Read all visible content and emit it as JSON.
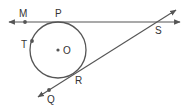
{
  "diagram": {
    "type": "geometry-tangent-lines-circle",
    "stroke_color": "#555555",
    "circle": {
      "center_label": "O",
      "cx": 58,
      "cy": 50,
      "r": 28
    },
    "points": [
      {
        "id": "M",
        "label": "M",
        "x": 25,
        "y": 22,
        "lx": 19,
        "ly": 17,
        "dot": true
      },
      {
        "id": "P",
        "label": "P",
        "x": 58,
        "y": 22,
        "lx": 55,
        "ly": 17,
        "dot": false
      },
      {
        "id": "S",
        "label": "S",
        "x": 157,
        "y": 22,
        "lx": 155,
        "ly": 34,
        "dot": false
      },
      {
        "id": "T",
        "label": "T",
        "x": 32,
        "y": 41,
        "lx": 21,
        "ly": 48,
        "dot": true
      },
      {
        "id": "O",
        "label": "O",
        "x": 58,
        "y": 50,
        "lx": 63,
        "ly": 54,
        "dot": true
      },
      {
        "id": "R",
        "label": "R",
        "x": 73,
        "y": 75,
        "lx": 75,
        "ly": 84,
        "dot": false
      },
      {
        "id": "Q",
        "label": "Q",
        "x": 49,
        "y": 90,
        "lx": 47,
        "ly": 103,
        "dot": true
      }
    ],
    "lines": [
      {
        "id": "line-MS",
        "description": "tangent line through M, P, S",
        "x1": 9,
        "y1": 22,
        "x2": 180,
        "y2": 22
      },
      {
        "id": "line-QS",
        "description": "tangent line through Q, R, S",
        "x1": 38,
        "y1": 97,
        "x2": 176,
        "y2": 10
      }
    ]
  }
}
